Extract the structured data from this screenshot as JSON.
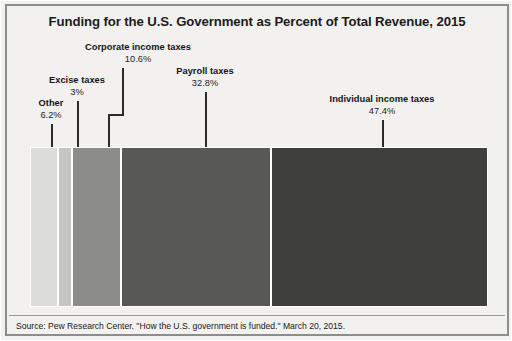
{
  "chart_data": {
    "type": "bar",
    "orientation": "horizontal-stacked",
    "title": "Funding for the U.S. Government as Percent of Total Revenue, 2015",
    "xlabel": "",
    "ylabel": "",
    "categories": [
      "Other",
      "Excise taxes",
      "Corporate income taxes",
      "Payroll taxes",
      "Individual income taxes"
    ],
    "values": [
      6.2,
      3.0,
      10.6,
      32.8,
      47.4
    ],
    "value_labels": [
      "6.2%",
      "3%",
      "10.6%",
      "32.8%",
      "47.4%"
    ],
    "unit": "percent of total revenue",
    "total": 100,
    "grid": false,
    "legend": "none (direct labels with leader lines)",
    "colors": [
      "#dcdcda",
      "#c5c5c3",
      "#8c8c8a",
      "#585856",
      "#3f3f3e"
    ],
    "segments": [
      {
        "name": "Other",
        "value": 6.2,
        "label": "6.2%",
        "color": "#dcdcda"
      },
      {
        "name": "Excise taxes",
        "value": 3.0,
        "label": "3%",
        "color": "#c5c5c3"
      },
      {
        "name": "Corporate income taxes",
        "value": 10.6,
        "label": "10.6%",
        "color": "#8c8c8a"
      },
      {
        "name": "Payroll taxes",
        "value": 32.8,
        "label": "32.8%",
        "color": "#585856"
      },
      {
        "name": "Individual income taxes",
        "value": 47.4,
        "label": "47.4%",
        "color": "#3f3f3e"
      }
    ]
  },
  "footer": {
    "source": "Source: Pew Research Center. \"How the U.S. government is funded.\" March 20, 2015."
  }
}
